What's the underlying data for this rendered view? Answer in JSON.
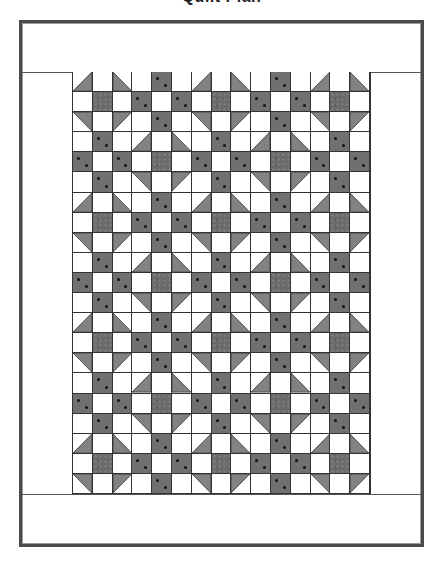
{
  "title": "Quilt Plan",
  "colors": {
    "outline": "#333333",
    "frame": "#4a4a4a",
    "triangle_fabric": "#828282",
    "center_fabric": "#6b6b6b",
    "dot_fabric": "#707070",
    "dot": "#111111",
    "background": "#ffffff"
  },
  "quilt": {
    "grid_columns": 15,
    "grid_rows": 21,
    "block_size": 3,
    "block_columns": 5,
    "block_rows": 7,
    "blocks": {
      "A": {
        "name": "Shoo-fly block",
        "pattern": [
          [
            "tri-br",
            "white",
            "tri-bl"
          ],
          [
            "white",
            "dark",
            "white"
          ],
          [
            "tri-tr",
            "white",
            "tri-tl"
          ]
        ]
      },
      "B": {
        "name": "Nine-patch block",
        "pattern": [
          [
            "white",
            "dot",
            "white"
          ],
          [
            "dot",
            "white",
            "dot"
          ],
          [
            "white",
            "dot",
            "white"
          ]
        ]
      }
    },
    "layout_rule": "Block A where (blockRow + blockCol) is even, Block B otherwise",
    "borders": [
      "top border strip",
      "bottom border strip",
      "left border strip",
      "right border strip"
    ]
  }
}
